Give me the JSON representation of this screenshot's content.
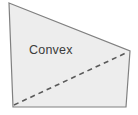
{
  "figure": {
    "kind": "geometry-diagram",
    "label": "Convex",
    "label_position": {
      "x": 29,
      "y": 54
    },
    "canvas": {
      "width": 138,
      "height": 115
    },
    "background_color": "#ffffff",
    "polygon": {
      "name": "convex-quadrilateral",
      "sides": 4,
      "fill_color": "#ededed",
      "stroke_color": "#808080",
      "stroke_width": 1.2,
      "points": "9,3 130,51 126,107 13,107",
      "vertices": [
        {
          "name": "top-left",
          "x": 9,
          "y": 3
        },
        {
          "name": "right",
          "x": 130,
          "y": 51
        },
        {
          "name": "bottom-right",
          "x": 126,
          "y": 107
        },
        {
          "name": "bottom-left",
          "x": 13,
          "y": 107
        }
      ]
    },
    "diagonal": {
      "name": "dashed-diagonal",
      "stroke_color": "#5a5a5a",
      "stroke_width": 1.6,
      "dash_pattern": "5,4",
      "from": {
        "x": 14,
        "y": 105
      },
      "to": {
        "x": 128,
        "y": 52
      }
    }
  }
}
